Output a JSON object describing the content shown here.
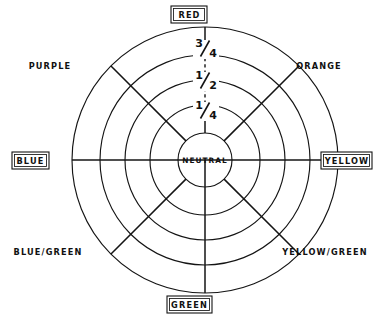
{
  "diagram": {
    "type": "radial-color-wheel",
    "center_label": "NEUTRAL",
    "background_color": "#ffffff",
    "line_color": "#141414",
    "center": {
      "x": 205,
      "y": 160
    },
    "center_circle_radius": 27,
    "ring_radii": [
      55,
      80,
      105,
      133
    ],
    "ring_count": 4,
    "spoke_count": 8,
    "saturation_labels": [
      {
        "id": "three-quarters",
        "numerator": "3",
        "denominator": "4",
        "text": "3/4",
        "radius": 105,
        "y": 48
      },
      {
        "id": "one-half",
        "numerator": "1",
        "denominator": "2",
        "text": "1/2",
        "radius": 80,
        "y": 80
      },
      {
        "id": "one-quarter",
        "numerator": "1",
        "denominator": "4",
        "text": "1/4",
        "radius": 55,
        "y": 110
      }
    ],
    "hues": [
      {
        "id": "red",
        "label": "RED",
        "angle_deg": 90,
        "boxed": true,
        "x": 189,
        "y": 14,
        "box_w": 36,
        "box_h": 16
      },
      {
        "id": "orange",
        "label": "ORANGE",
        "angle_deg": 45,
        "boxed": false,
        "x": 319,
        "y": 66
      },
      {
        "id": "yellow",
        "label": "YELLOW",
        "angle_deg": 0,
        "boxed": true,
        "x": 346,
        "y": 160,
        "box_w": 50,
        "box_h": 16
      },
      {
        "id": "yellow-green",
        "label": "YELLOW/GREEN",
        "angle_deg": -45,
        "boxed": false,
        "x": 325,
        "y": 252
      },
      {
        "id": "green",
        "label": "GREEN",
        "angle_deg": -90,
        "boxed": true,
        "x": 189,
        "y": 303,
        "box_w": 44,
        "box_h": 16
      },
      {
        "id": "blue-green",
        "label": "BLUE/GREEN",
        "angle_deg": -135,
        "boxed": false,
        "x": 48,
        "y": 252
      },
      {
        "id": "blue",
        "label": "BLUE",
        "angle_deg": 180,
        "boxed": true,
        "x": 30,
        "y": 160,
        "box_w": 36,
        "box_h": 16
      },
      {
        "id": "purple",
        "label": "PURPLE",
        "angle_deg": 135,
        "boxed": false,
        "x": 50,
        "y": 66
      }
    ]
  }
}
